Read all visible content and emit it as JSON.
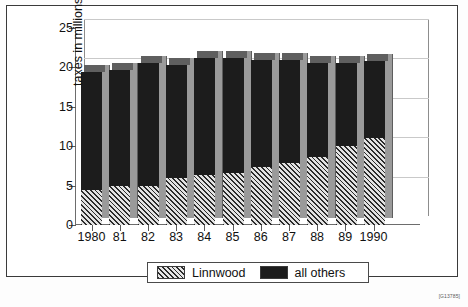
{
  "chart_data": {
    "type": "bar",
    "subtype": "stacked-3d-column",
    "title": "",
    "xlabel": "",
    "ylabel": "taxes in millions",
    "ylim": [
      0,
      25
    ],
    "yticks": [
      0,
      5,
      10,
      15,
      20,
      25
    ],
    "grid": true,
    "legend_position": "bottom",
    "categories": [
      "1980",
      "81",
      "82",
      "83",
      "84",
      "85",
      "86",
      "87",
      "88",
      "89",
      "1990"
    ],
    "series": [
      {
        "name": "Linnwood",
        "pattern": "diagonal-hatch",
        "color": "#8e8e8e",
        "values": [
          4.5,
          5.0,
          5.0,
          6.0,
          6.4,
          6.6,
          7.4,
          7.9,
          8.6,
          10.0,
          11.0
        ]
      },
      {
        "name": "all others",
        "pattern": "solid",
        "color": "#1c1c1c",
        "values": [
          14.9,
          14.7,
          15.6,
          14.3,
          14.8,
          14.6,
          13.6,
          13.1,
          11.9,
          10.6,
          9.8
        ]
      }
    ],
    "totals": [
      19.4,
      19.7,
      20.6,
      20.3,
      21.2,
      21.2,
      21.0,
      21.0,
      20.5,
      20.6,
      20.8
    ]
  },
  "legend": {
    "items": [
      {
        "label": "Linnwood",
        "swatch": "hatch-swatch"
      },
      {
        "label": "all others",
        "swatch": "solid-black-swatch"
      }
    ]
  },
  "footer": {
    "code": "[G13785]"
  }
}
